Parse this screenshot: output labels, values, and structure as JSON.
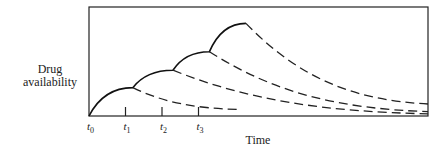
{
  "chart_data": {
    "type": "line",
    "title": "",
    "xlabel": "Time",
    "ylabel": "Drug availability",
    "ylabel_lines": [
      "Drug",
      "availability"
    ],
    "x_ticks": [
      {
        "base": "t",
        "sub": "0",
        "x": 0
      },
      {
        "base": "t",
        "sub": "1",
        "x": 1
      },
      {
        "base": "t",
        "sub": "2",
        "x": 2
      },
      {
        "base": "t",
        "sub": "3",
        "x": 3
      }
    ],
    "xlim": [
      0,
      9.4
    ],
    "ylim": [
      0,
      1
    ],
    "grid": false,
    "legend": "none",
    "accumulation_curve": {
      "style": "solid",
      "points": [
        {
          "x": 0,
          "y": 0
        },
        {
          "x": 1.2,
          "y": 0.26
        },
        {
          "x": 2.3,
          "y": 0.42
        },
        {
          "x": 3.3,
          "y": 0.59
        },
        {
          "x": 4.3,
          "y": 0.85
        }
      ]
    },
    "decay_series": [
      {
        "name": "dose-1 decay",
        "style": "dashed",
        "start": {
          "x": 1.2,
          "y": 0.26
        },
        "end": {
          "x": 4.1,
          "y": 0.06
        }
      },
      {
        "name": "dose-2 decay",
        "style": "dashed",
        "start": {
          "x": 2.3,
          "y": 0.42
        },
        "end": {
          "x": 9.4,
          "y": 0.02
        }
      },
      {
        "name": "dose-3 decay",
        "style": "dashed",
        "start": {
          "x": 3.3,
          "y": 0.59
        },
        "end": {
          "x": 9.4,
          "y": 0.04
        }
      },
      {
        "name": "dose-4 decay",
        "style": "dashed",
        "start": {
          "x": 4.3,
          "y": 0.85
        },
        "end": {
          "x": 9.4,
          "y": 0.11
        }
      }
    ]
  }
}
